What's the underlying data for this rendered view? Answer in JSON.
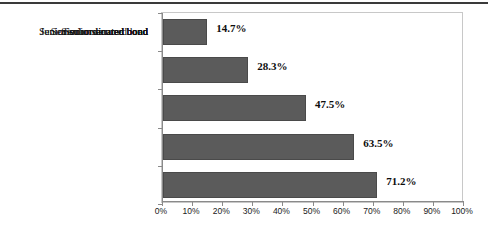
{
  "chart_data": {
    "type": "bar",
    "orientation": "horizontal",
    "title": "",
    "subtitle": "",
    "xlabel": "",
    "ylabel": "",
    "categories": [
      "Junior subordinated bond",
      "Senior subordinated bond",
      "Senior unsecured bond",
      "Senior secured bond",
      "Senior secured loan"
    ],
    "values": [
      14.7,
      28.3,
      47.5,
      63.5,
      71.2
    ],
    "data_labels": [
      "14.7%",
      "28.3%",
      "47.5%",
      "63.5%",
      "71.2%"
    ],
    "xlim": [
      0,
      100
    ],
    "xticks": [
      0,
      10,
      20,
      30,
      40,
      50,
      60,
      70,
      80,
      90,
      100
    ],
    "xtick_labels": [
      "0%",
      "10%",
      "20%",
      "30%",
      "40%",
      "50%",
      "60%",
      "70%",
      "80%",
      "90%",
      "100%"
    ],
    "grid": false,
    "legend": null,
    "bar_color": "#5b5b5b",
    "bar_border_color": "#4a4a4a",
    "frame_color": "#c8c8c8",
    "axis_color": "#8a8a8a",
    "label_color": "#111111",
    "value_label_color": "#0d0d0d"
  },
  "decorations": {
    "top_rule_color": "#3a3a3a"
  }
}
